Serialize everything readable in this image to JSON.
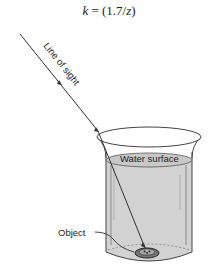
{
  "formula": {
    "text": "k = (1.7/z)",
    "var_k": "k",
    "equals": " = (1.7/",
    "var_z": "z",
    "close": ")"
  },
  "labels": {
    "line_of_sight": "Line of sight",
    "water_surface": "Water surface",
    "object": "Object"
  },
  "colors": {
    "line": "#333333",
    "water": "#d4d4d4",
    "glass_edge": "#555555",
    "background": "#ffffff"
  }
}
